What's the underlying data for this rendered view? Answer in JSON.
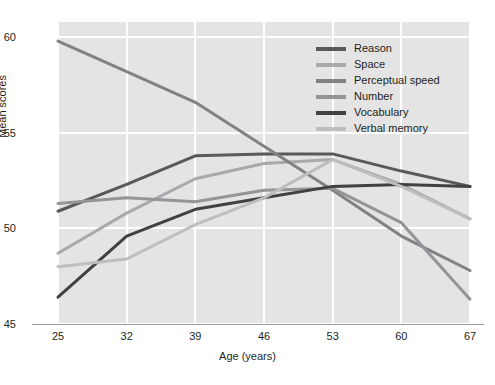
{
  "chart_data": {
    "type": "line",
    "title": "",
    "xlabel": "Age (years)",
    "ylabel": "Mean scores",
    "categories": [
      25,
      32,
      39,
      46,
      53,
      60,
      67
    ],
    "x": [
      25,
      32,
      39,
      46,
      53,
      60,
      67
    ],
    "xlim": [
      25,
      67
    ],
    "ylim": [
      45,
      60.8
    ],
    "xticks": [
      "25",
      "32",
      "39",
      "46",
      "53",
      "60",
      "67"
    ],
    "yticks": [
      "45",
      "50",
      "55",
      "60"
    ],
    "grid": true,
    "legend_position": "top-right",
    "series": [
      {
        "name": "Reason",
        "color": "#58595b",
        "values": [
          50.9,
          52.3,
          53.8,
          53.9,
          53.9,
          53.0,
          52.2
        ]
      },
      {
        "name": "Space",
        "color": "#a7a9ac",
        "values": [
          48.7,
          50.8,
          52.6,
          53.4,
          53.6,
          52.3,
          50.5
        ]
      },
      {
        "name": "Perceptual speed",
        "color": "#808285",
        "values": [
          59.8,
          58.2,
          56.6,
          54.3,
          52.0,
          49.6,
          47.8
        ]
      },
      {
        "name": "Number",
        "color": "#939598",
        "values": [
          51.3,
          51.6,
          51.4,
          52.0,
          52.1,
          50.3,
          46.3
        ]
      },
      {
        "name": "Vocabulary",
        "color": "#414042",
        "values": [
          46.4,
          49.6,
          51.0,
          51.6,
          52.2,
          52.3,
          52.2
        ]
      },
      {
        "name": "Verbal memory",
        "color": "#bcbec0",
        "values": [
          48.0,
          48.4,
          50.2,
          51.6,
          53.6,
          52.2,
          50.5
        ]
      }
    ]
  }
}
